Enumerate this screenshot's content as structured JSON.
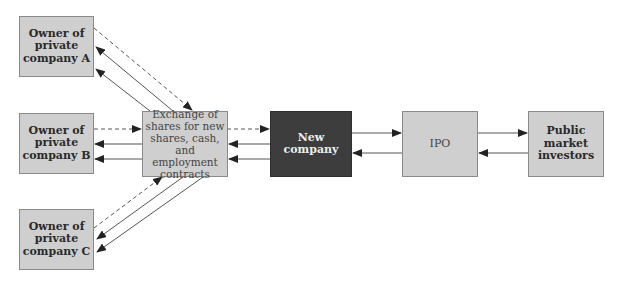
{
  "diagram": {
    "nodes": {
      "owner_a": {
        "label_lines": [
          "Owner of",
          "private",
          "company A"
        ]
      },
      "owner_b": {
        "label_lines": [
          "Owner of",
          "private",
          "company B"
        ]
      },
      "owner_c": {
        "label_lines": [
          "Owner of",
          "private",
          "company C"
        ]
      },
      "exchange": {
        "label_lines": [
          "Exchange of",
          "shares for new",
          "shares, cash, and",
          "employment",
          "contracts"
        ]
      },
      "new_company": {
        "label_lines": [
          "New",
          "company"
        ]
      },
      "ipo": {
        "label_lines": [
          "IPO"
        ]
      },
      "public_investors": {
        "label_lines": [
          "Public",
          "market",
          "investors"
        ]
      }
    },
    "edges": [
      {
        "from": "owner_a",
        "to": "exchange",
        "style": "dashed"
      },
      {
        "from": "exchange",
        "to": "owner_a",
        "style": "solid",
        "count": 2
      },
      {
        "from": "owner_b",
        "to": "exchange",
        "style": "dashed"
      },
      {
        "from": "exchange",
        "to": "owner_b",
        "style": "solid",
        "count": 2
      },
      {
        "from": "owner_c",
        "to": "exchange",
        "style": "dashed"
      },
      {
        "from": "exchange",
        "to": "owner_c",
        "style": "solid",
        "count": 2
      },
      {
        "from": "exchange",
        "to": "new_company",
        "style": "dashed"
      },
      {
        "from": "new_company",
        "to": "exchange",
        "style": "solid",
        "count": 2
      },
      {
        "from": "new_company",
        "to": "ipo",
        "style": "solid"
      },
      {
        "from": "ipo",
        "to": "new_company",
        "style": "solid"
      },
      {
        "from": "ipo",
        "to": "public_investors",
        "style": "solid"
      },
      {
        "from": "public_investors",
        "to": "ipo",
        "style": "solid"
      }
    ],
    "colors": {
      "box_fill": "#cfcfcf",
      "box_border": "#8a8a8a",
      "dark_box_fill": "#3d3d3d",
      "line": "#555555",
      "arrowhead": "#222222"
    }
  }
}
